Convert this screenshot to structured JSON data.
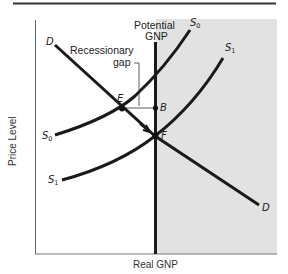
{
  "figure": {
    "x_axis_label": "Real GNP",
    "y_axis_label": "Price Level",
    "potential_gnp_label_line1": "Potential",
    "potential_gnp_label_line2": "GNP",
    "gap_label_line1": "Recessionary",
    "gap_label_line2": "gap",
    "curves": {
      "demand": {
        "name": "D",
        "label_top": "D",
        "label_bottom": "D"
      },
      "supply0": {
        "name": "S",
        "subscript": "0"
      },
      "supply1": {
        "name": "S",
        "subscript": "1"
      }
    },
    "points": {
      "E": "E",
      "B": "B",
      "F": "F"
    },
    "colors": {
      "shaded_region": "#e2e2e2",
      "curve": "#1a1a1a",
      "axis": "#555555",
      "top_rule": "#333333"
    }
  }
}
